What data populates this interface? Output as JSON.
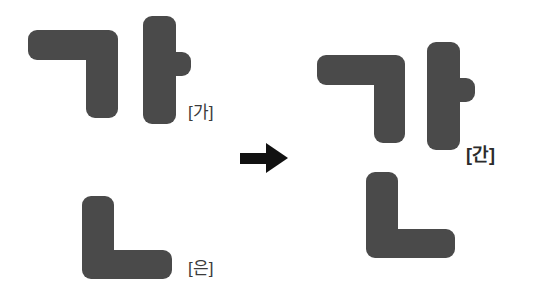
{
  "canvas": {
    "width": 545,
    "height": 302,
    "background": "#ffffff"
  },
  "style": {
    "stroke_color": "#4a4a4a",
    "arrow_color": "#111111",
    "label_color": "#3b3b3b",
    "label_color_bold": "#2b2b2b",
    "corner_radius_px": 9
  },
  "diagram": {
    "type": "hangul-composition",
    "operator": "arrow-right",
    "equation": "[가] + [은] = [간]"
  },
  "labels": {
    "source_top": "[가]",
    "source_bottom": "[은]",
    "result": "[간]"
  },
  "shapes": {
    "left_top_group": {
      "name": "ga-syllable",
      "parts": [
        {
          "jamo": "giyeok",
          "name": "consonant-giyeok",
          "x": 28,
          "y": 30,
          "w": 90,
          "h": 88
        },
        {
          "jamo": "a",
          "name": "vowel-a",
          "x": 143,
          "y": 16,
          "w": 48,
          "h": 108
        }
      ]
    },
    "left_bottom_group": {
      "name": "eun-final-nieun",
      "parts": [
        {
          "jamo": "nieun",
          "name": "consonant-nieun",
          "x": 82,
          "y": 196,
          "w": 90,
          "h": 83
        }
      ]
    },
    "right_group": {
      "name": "gan-syllable",
      "parts": [
        {
          "jamo": "giyeok",
          "name": "consonant-giyeok",
          "x": 317,
          "y": 55,
          "w": 88,
          "h": 88
        },
        {
          "jamo": "a",
          "name": "vowel-a",
          "x": 427,
          "y": 42,
          "w": 48,
          "h": 108
        },
        {
          "jamo": "nieun",
          "name": "consonant-nieun",
          "x": 366,
          "y": 172,
          "w": 89,
          "h": 86
        }
      ]
    }
  },
  "arrow": {
    "name": "transform-arrow",
    "x": 240,
    "y": 143,
    "shaft_w": 26,
    "shaft_h": 11,
    "head_w": 22,
    "head_h": 30
  },
  "label_positions": {
    "source_top": {
      "x": 188,
      "y": 98
    },
    "source_bottom": {
      "x": 188,
      "y": 254
    },
    "result": {
      "x": 466,
      "y": 140
    }
  }
}
